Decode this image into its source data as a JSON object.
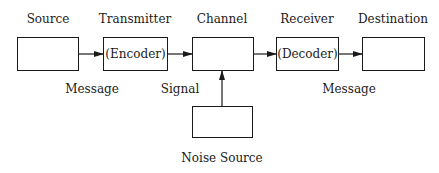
{
  "diagram": {
    "type": "communication-model",
    "nodes": [
      {
        "id": "source",
        "title": "Source",
        "inner": ""
      },
      {
        "id": "transmitter",
        "title": "Transmitter",
        "inner": "(Encoder)"
      },
      {
        "id": "channel",
        "title": "Channel",
        "inner": ""
      },
      {
        "id": "receiver",
        "title": "Receiver",
        "inner": "(Decoder)"
      },
      {
        "id": "destination",
        "title": "Destination",
        "inner": ""
      },
      {
        "id": "noise",
        "title": "Noise Source",
        "inner": ""
      }
    ],
    "edges": [
      {
        "from": "source",
        "to": "transmitter",
        "label": "Message"
      },
      {
        "from": "transmitter",
        "to": "channel",
        "label": "Signal"
      },
      {
        "from": "channel",
        "to": "receiver",
        "label": ""
      },
      {
        "from": "receiver",
        "to": "destination",
        "label": "Message"
      },
      {
        "from": "noise",
        "to": "channel",
        "label": ""
      }
    ],
    "edge_labels": {
      "message_in": "Message",
      "signal": "Signal",
      "message_out": "Message"
    },
    "colors": {
      "stroke": "#1a1a1a",
      "background": "#ffffff"
    }
  }
}
